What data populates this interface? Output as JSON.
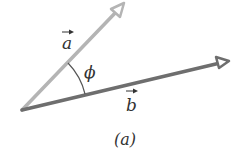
{
  "diagram": {
    "vector_a": {
      "label": "a",
      "color": "#b4b4b4",
      "from": [
        22,
        110
      ],
      "to": [
        124,
        4
      ]
    },
    "vector_b": {
      "label": "b",
      "color": "#6e6e6e",
      "from": [
        22,
        110
      ],
      "to": [
        229,
        61
      ]
    },
    "angle": {
      "label": "ϕ"
    },
    "caption": "(a)"
  }
}
